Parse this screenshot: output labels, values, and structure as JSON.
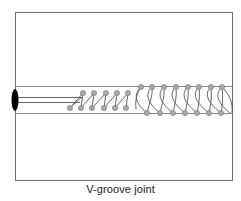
{
  "figure": {
    "caption": "V-groove joint",
    "colors": {
      "frame": "#6e6e6e",
      "channel": "#8a8a8a",
      "fiber": "#555555",
      "dot_fill": "#a8a8a8",
      "dot_stroke": "#7a7a7a",
      "coil": "#555555",
      "end_cap": "#000000"
    },
    "components": {
      "end_cap": {
        "label": "fiber-end-cap",
        "cx": 15,
        "cy": 100,
        "rx": 3.5,
        "ry": 11
      },
      "frame": {
        "x": 15,
        "y": 12,
        "w": 217,
        "h": 168
      },
      "channel": {
        "top_y": 86,
        "bottom_y": 113,
        "x1": 15,
        "x2": 232
      },
      "fibers": [
        {
          "y": 97,
          "x1": 15,
          "x2": 82
        },
        {
          "y": 102,
          "x1": 15,
          "x2": 80
        }
      ],
      "small_coil": {
        "top_y": 93,
        "bottom_y": 108,
        "top_x": [
          83,
          94,
          106,
          117,
          128
        ],
        "bottom_x": [
          70,
          81,
          92,
          104,
          115,
          126
        ]
      },
      "large_coil": {
        "top_y": 87,
        "bottom_y": 113,
        "top_x": [
          141,
          152,
          164,
          176,
          188,
          199,
          211,
          222
        ],
        "bottom_x": [
          147,
          160,
          173,
          185,
          197,
          209,
          221
        ]
      }
    }
  }
}
